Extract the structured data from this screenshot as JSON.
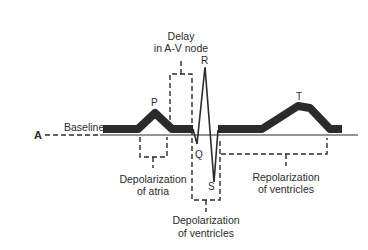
{
  "diagram": {
    "panel_label": "A",
    "baseline_label": "Baseline",
    "waves": {
      "p": "P",
      "q": "Q",
      "r": "R",
      "s": "S",
      "t": "T"
    },
    "annotations": {
      "delay_line1": "Delay",
      "delay_line2": "in A-V node",
      "atria_line1": "Depolarization",
      "atria_line2": "of atria",
      "ventricles_depol_line1": "Depolarization",
      "ventricles_depol_line2": "of ventricles",
      "ventricles_repol_line1": "Repolarization",
      "ventricles_repol_line2": "of ventricles"
    },
    "colors": {
      "trace": "#2b2b2b",
      "background": "#ffffff"
    }
  }
}
